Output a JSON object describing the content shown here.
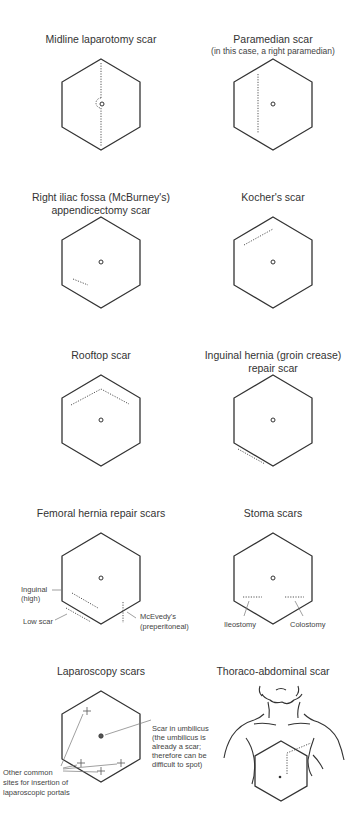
{
  "panels": [
    {
      "title": "Midline laparotomy scar"
    },
    {
      "title": "Paramedian scar",
      "subtitle": "(in this case, a right paramedian)"
    },
    {
      "title_line1": "Right iliac fossa (McBurney's)",
      "title_line2": "appendicectomy scar"
    },
    {
      "title": "Kocher's scar"
    },
    {
      "title": "Rooftop scar"
    },
    {
      "title_line1": "Inguinal hernia (groin crease)",
      "title_line2": "repair scar"
    },
    {
      "title": "Femoral hernia repair scars",
      "labels": {
        "inguinal_line1": "Inguinal",
        "inguinal_line2": "(high)",
        "low": "Low scar",
        "mcevedy_line1": "McEvedy's",
        "mcevedy_line2": "(preperitoneal)"
      }
    },
    {
      "title": "Stoma scars",
      "labels": {
        "ileostomy": "Ileostomy",
        "colostomy": "Colostomy"
      }
    },
    {
      "title": "Laparoscopy scars",
      "labels": {
        "umbilicus": [
          "Scar in umbilicus",
          "(the umbilicus is",
          "already a scar;",
          "therefore can be",
          "difficult to spot)"
        ],
        "other": [
          "Other common",
          "sites for insertion of",
          "laparoscopic portals"
        ]
      }
    },
    {
      "title": "Thoraco-abdominal scar"
    }
  ]
}
